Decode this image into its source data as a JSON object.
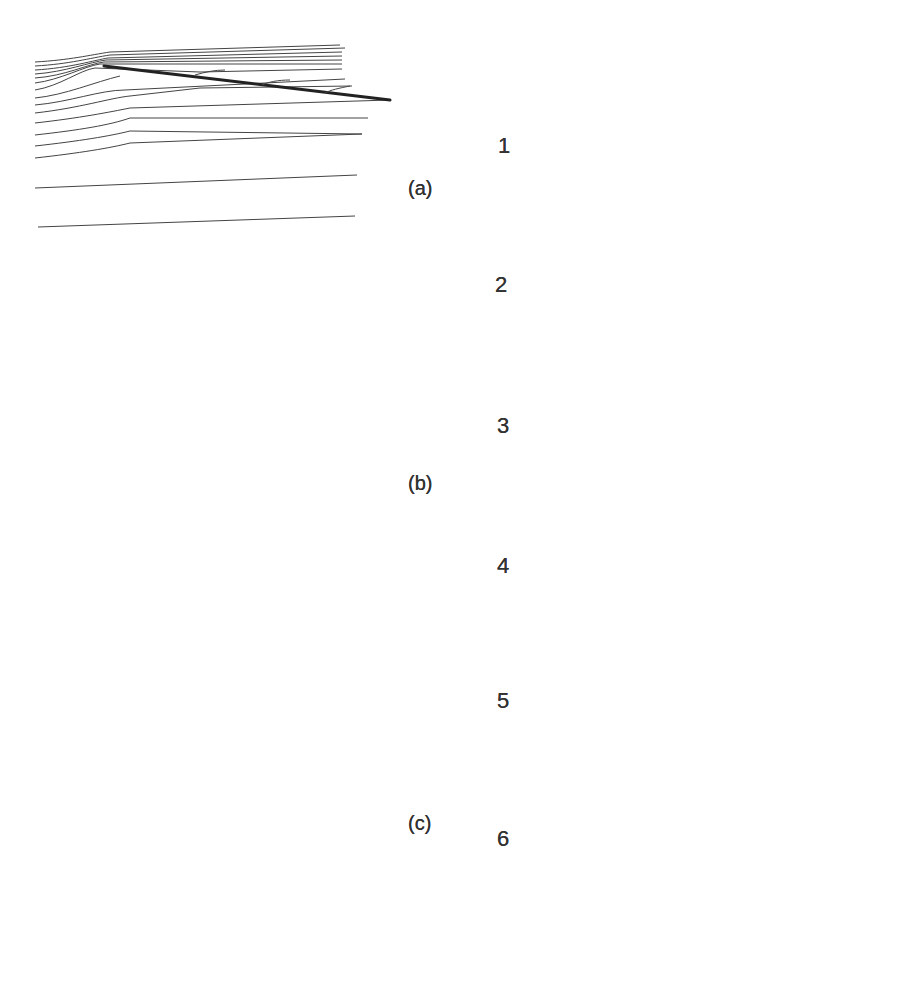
{
  "figure": {
    "left_column": {
      "panels": [
        {
          "id": "a",
          "label": "(a)",
          "description": "Inclined flat plate, streamlines deflected upward at leading edge"
        },
        {
          "id": "b",
          "label": "(b)",
          "description": "Two inclined flat plates (opposite incidence) with parallel streamlines"
        },
        {
          "id": "c",
          "label": "(c)",
          "description": "Bent/angled plates (chevron shapes) with curved streamlines"
        }
      ]
    },
    "right_column": {
      "panels": [
        {
          "id": "1",
          "label": "1",
          "shape": "triangle / wedge"
        },
        {
          "id": "2",
          "label": "2",
          "shape": "flat front with wedge, separation bubbles"
        },
        {
          "id": "3",
          "label": "3",
          "shape": "tapered nose with wedge"
        },
        {
          "id": "4",
          "label": "4",
          "shape": "tapered nose with wedge"
        },
        {
          "id": "5",
          "label": "5",
          "shape": "rectangle with dashed wedge"
        },
        {
          "id": "6",
          "label": "6",
          "shape": "tapered nose rectangle with dashed wedge"
        }
      ]
    }
  }
}
